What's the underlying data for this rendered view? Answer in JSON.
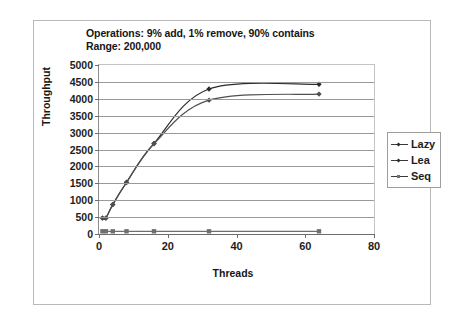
{
  "figure": {
    "title_lines": [
      "Operations: 9% add, 1% remove, 90% contains",
      "Range: 200,000"
    ],
    "border_color": "#b9b9b9",
    "background": "#ffffff"
  },
  "chart_data": {
    "type": "line",
    "title": "Operations: 9% add, 1% remove, 90% contains\nRange: 200,000",
    "subtitle": "Range: 200,000",
    "xlabel": "Threads",
    "ylabel": "Throughput",
    "xlim": [
      0,
      80
    ],
    "ylim": [
      0,
      5000
    ],
    "grid": true,
    "legend_position": "right",
    "xticks": [
      0,
      20,
      40,
      60,
      80
    ],
    "xtick_labels": [
      "0",
      "20",
      "40",
      "60",
      "80"
    ],
    "yticks": [
      0,
      500,
      1000,
      1500,
      2000,
      2500,
      3000,
      3500,
      4000,
      4500,
      5000
    ],
    "ytick_labels": [
      "0",
      "500",
      "1000",
      "1500",
      "2000",
      "2500",
      "3000",
      "3500",
      "4000",
      "4500",
      "5000"
    ],
    "x": [
      1,
      2,
      4,
      8,
      16,
      32,
      64
    ],
    "series": [
      {
        "name": "Lazy",
        "marker": "diamond",
        "color": "#2b2b2b",
        "values": [
          470,
          470,
          870,
          1530,
          2680,
          4290,
          4430
        ]
      },
      {
        "name": "Lea",
        "marker": "diamond",
        "color": "#4f4f4f",
        "values": [
          470,
          470,
          870,
          1520,
          2670,
          3960,
          4140
        ]
      },
      {
        "name": "Seq",
        "marker": "square",
        "color": "#6f6f6f",
        "values": [
          80,
          80,
          80,
          80,
          80,
          80,
          80
        ]
      }
    ]
  },
  "legend": {
    "items": [
      {
        "label": "Lazy",
        "marker": "diamond"
      },
      {
        "label": "Lea",
        "marker": "diamond"
      },
      {
        "label": "Seq",
        "marker": "square"
      }
    ]
  }
}
